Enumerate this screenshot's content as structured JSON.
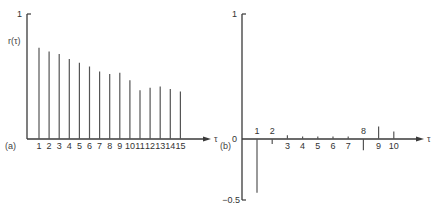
{
  "chart_data": [
    {
      "type": "bar",
      "panel_label": "(a)",
      "ylabel": "r(τ)",
      "xlabel": "τ",
      "ylim": [
        0,
        1
      ],
      "ytick_labels": [
        "1"
      ],
      "categories": [
        "1",
        "2",
        "3",
        "4",
        "5",
        "6",
        "7",
        "8",
        "9",
        "10",
        "11",
        "12",
        "13",
        "14",
        "15"
      ],
      "values": [
        0.73,
        0.7,
        0.68,
        0.64,
        0.61,
        0.58,
        0.54,
        0.52,
        0.53,
        0.47,
        0.39,
        0.41,
        0.42,
        0.4,
        0.38
      ],
      "grid": false,
      "style": "stem"
    },
    {
      "type": "bar",
      "panel_label": "(b)",
      "ylabel": "",
      "xlabel": "τ",
      "ylim": [
        -0.5,
        1
      ],
      "ytick_labels": [
        "1",
        "0",
        "−0.5"
      ],
      "categories": [
        "1",
        "2",
        "3",
        "4",
        "5",
        "6",
        "7",
        "8",
        "9",
        "10"
      ],
      "values": [
        -0.43,
        -0.04,
        0.03,
        0.01,
        0.01,
        0.01,
        0.01,
        -0.09,
        0.1,
        0.06
      ],
      "grid": false,
      "style": "stem"
    }
  ]
}
